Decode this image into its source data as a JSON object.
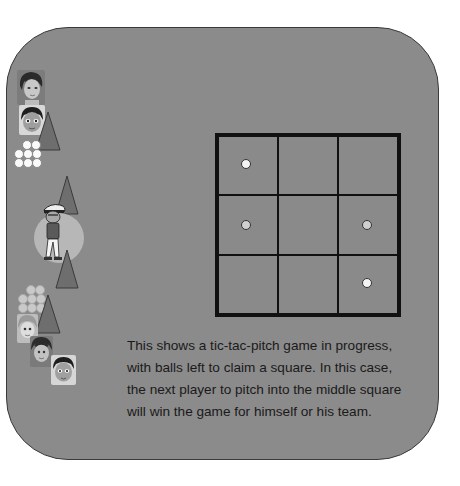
{
  "caption": {
    "text": "This shows a tic-tac-pitch game in progress, with balls left to claim a square. In this case, the next player to pitch into the middle square will win the game for himself or his team."
  },
  "board": {
    "rows": 3,
    "cols": 3,
    "cells": [
      {
        "row": 0,
        "col": 0,
        "ball": "white"
      },
      {
        "row": 0,
        "col": 1,
        "ball": null
      },
      {
        "row": 0,
        "col": 2,
        "ball": null
      },
      {
        "row": 1,
        "col": 0,
        "ball": "gray"
      },
      {
        "row": 1,
        "col": 1,
        "ball": null
      },
      {
        "row": 1,
        "col": 2,
        "ball": "gray"
      },
      {
        "row": 2,
        "col": 0,
        "ball": null
      },
      {
        "row": 2,
        "col": 1,
        "ball": null
      },
      {
        "row": 2,
        "col": 2,
        "ball": "white"
      }
    ]
  },
  "team_top": {
    "players": [
      "player-face-girl",
      "player-face-boy"
    ],
    "balls_left": 8,
    "ball_color": "white"
  },
  "pitcher": {
    "icon": "pitcher-character",
    "cones": 2
  },
  "team_bottom": {
    "players": [
      "player-face-girl-blonde",
      "player-face-boy-brown",
      "player-face-boy-dark"
    ],
    "balls_left": 8,
    "ball_color": "gray"
  },
  "colors": {
    "panel": "#8b8b8b",
    "grid_line": "#111111",
    "cone": "#6e6e6e",
    "spotlight": "#b7b7b7",
    "ball_white": "#f4f4f4",
    "ball_gray": "#cfcfcf"
  }
}
